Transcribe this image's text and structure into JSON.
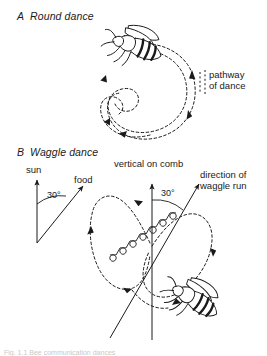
{
  "figure": {
    "title_a": "Round dance",
    "letter_a": "A",
    "title_b": "Waggle dance",
    "letter_b": "B",
    "caption_partial": "Fig. 1.1 Bee communication dances"
  },
  "panel_a": {
    "label": "Round dance",
    "annotations": {
      "pathway_line1": "pathway",
      "pathway_line2": "of dance"
    },
    "icons": {
      "bee": "bee-icon",
      "path": "dashed-loop-path"
    }
  },
  "panel_b": {
    "label": "Waggle dance",
    "annotations": {
      "sun": "sun",
      "food": "food",
      "angle_left": "30°",
      "vertical_on_comb": "vertical on comb",
      "angle_right": "30°",
      "direction_line1": "direction of",
      "direction_line2": "waggle run"
    },
    "icons": {
      "bee": "bee-icon",
      "path": "dashed-figure-eight-path",
      "waggle": "zigzag-waggle-run"
    }
  },
  "colors": {
    "ink": "#1a1a1a",
    "background": "#ffffff",
    "faint": "#c9c9c9"
  }
}
